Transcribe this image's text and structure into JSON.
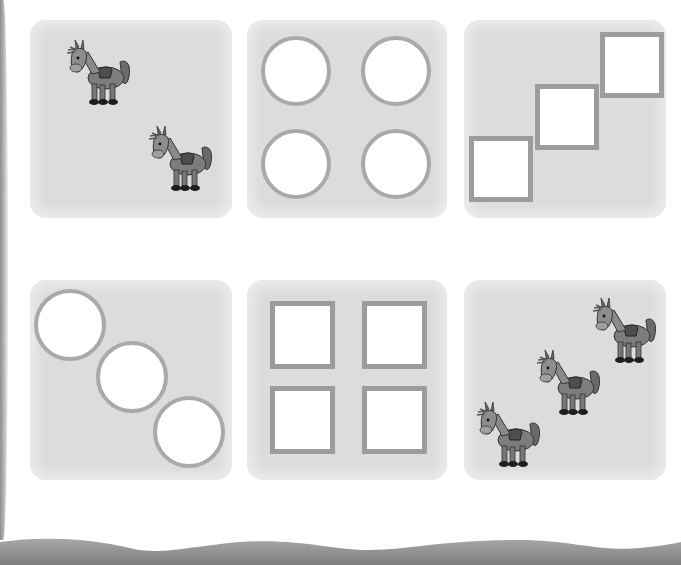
{
  "worksheet": {
    "rows": [
      {
        "panels": [
          {
            "content": "donkey",
            "count": 2,
            "arrangement": "diagonal"
          },
          {
            "content": "circle",
            "count": 4,
            "arrangement": "grid-2x2"
          },
          {
            "content": "square",
            "count": 3,
            "arrangement": "staircase"
          }
        ]
      },
      {
        "panels": [
          {
            "content": "circle",
            "count": 3,
            "arrangement": "diagonal"
          },
          {
            "content": "square",
            "count": 4,
            "arrangement": "grid-2x2"
          },
          {
            "content": "donkey",
            "count": 3,
            "arrangement": "diagonal"
          }
        ]
      }
    ]
  },
  "colors": {
    "panel_bg": "#dcdcdc",
    "shape_border": "#a9a9a9",
    "shape_fill": "#ffffff",
    "page_bg": "#ffffff",
    "edge_shadow": "#8a8a8a"
  }
}
